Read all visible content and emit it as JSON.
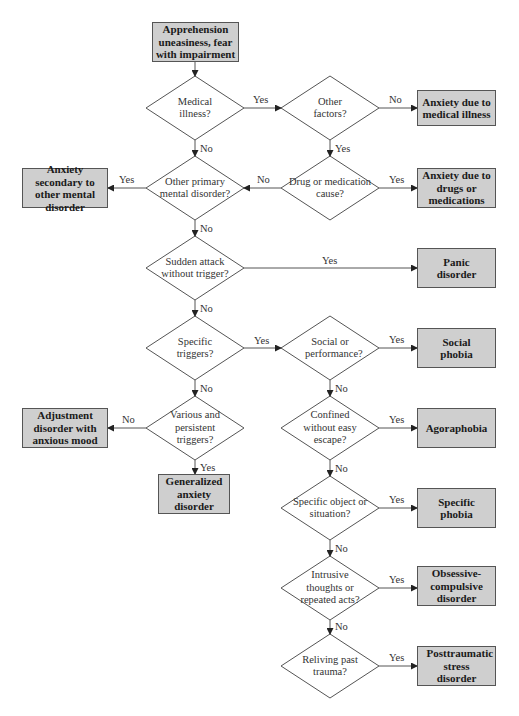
{
  "start": {
    "label": "Apprehension uneasiness, fear with impairment"
  },
  "decisions": {
    "medical_illness": "Medical illness?",
    "other_factors": "Other factors?",
    "other_primary": "Other primary mental disorder?",
    "drug_medication": "Drug or medication cause?",
    "sudden_attack": "Sudden attack without trigger?",
    "specific_triggers": "Specific triggers?",
    "social_performance": "Social or performance?",
    "various_persistent": "Various and persistent triggers?",
    "confined": "Confined without easy escape?",
    "specific_object": "Specific object or situation?",
    "intrusive": "Intrusive thoughts or repeated acts?",
    "reliving": "Reliving past trauma?"
  },
  "outcomes": {
    "medical": "Anxiety due to medical illness",
    "drugs": "Anxiety due to drugs or medications",
    "secondary": "Anxiety secondary to other mental disorder",
    "panic": "Panic disorder",
    "social": "Social phobia",
    "adjustment": "Adjustment disorder with anxious mood",
    "agoraphobia": "Agoraphobia",
    "gad": "Generalized anxiety disorder",
    "specific_phobia": "Specific phobia",
    "ocd": "Obsessive-compulsive disorder",
    "ptsd": "Posttraumatic stress disorder"
  },
  "edges": {
    "yes": "Yes",
    "no": "No"
  },
  "colors": {
    "box_fill": "#cfcfcf",
    "line": "#555555"
  }
}
